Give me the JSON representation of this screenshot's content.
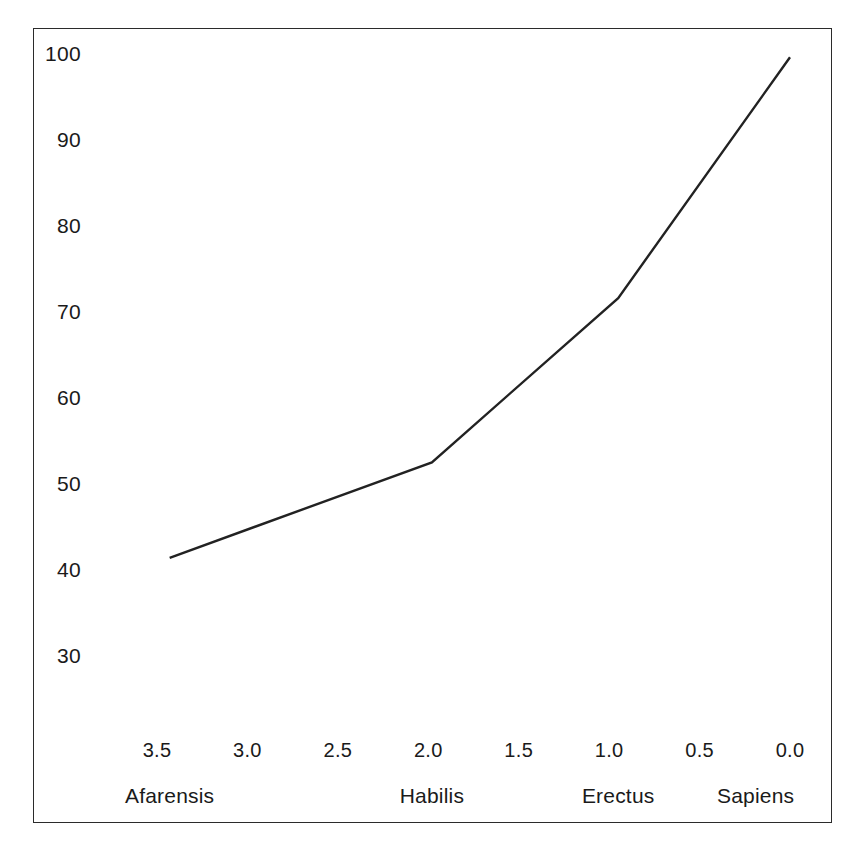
{
  "figure": {
    "background_color": "#ffffff",
    "frame_color": "#2b2b2b",
    "line_color": "#222222"
  },
  "chart_data": {
    "type": "line",
    "title": "",
    "subtitle": "",
    "xlabel": "",
    "ylabel": "",
    "grid": false,
    "legend": false,
    "x_axis_inverted": true,
    "xlim": [
      3.75,
      -0.05
    ],
    "ylim": [
      25.5,
      103.5
    ],
    "x_tick_labels": [
      "3.5",
      "3.0",
      "2.5",
      "2.0",
      "1.5",
      "1.0",
      "0.5",
      "0.0"
    ],
    "x_tick_values": [
      3.5,
      3.0,
      2.5,
      2.0,
      1.5,
      1.0,
      0.5,
      0.0
    ],
    "y_tick_labels": [
      "100",
      "90",
      "80",
      "70",
      "60",
      "50",
      "40",
      "30"
    ],
    "y_tick_values": [
      100,
      90,
      80,
      70,
      60,
      50,
      40,
      30
    ],
    "category_labels": [
      "Afarensis",
      "Habilis",
      "Erectus",
      "Sapiens"
    ],
    "category_x_values": [
      3.43,
      1.98,
      0.95,
      0.19
    ],
    "series": [
      {
        "name": "series-1",
        "x": [
          3.43,
          1.98,
          0.95,
          0.0
        ],
        "values": [
          41.3,
          52.4,
          71.5,
          99.5
        ]
      }
    ],
    "points": [
      {
        "label": "Afarensis",
        "x": 3.43,
        "y": 41.3
      },
      {
        "label": "Habilis",
        "x": 1.98,
        "y": 52.4
      },
      {
        "label": "Erectus",
        "x": 0.95,
        "y": 71.5
      },
      {
        "label": "Sapiens",
        "x": 0.0,
        "y": 99.5
      }
    ]
  }
}
